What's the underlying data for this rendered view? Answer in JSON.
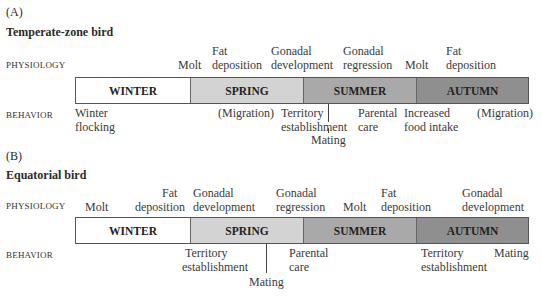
{
  "panels": [
    {
      "letter": "(A)",
      "title": "Temperate-zone bird",
      "physiology_label": "PHYSIOLOGY",
      "behavior_label": "BEHAVIOR",
      "seasons": [
        {
          "label": "WINTER",
          "color": "#ffffff"
        },
        {
          "label": "SPRING",
          "color": "#d3d3d3"
        },
        {
          "label": "SUMMER",
          "color": "#a9a9a9"
        },
        {
          "label": "AUTUMN",
          "color": "#8f8f8f"
        }
      ],
      "physiology": [
        {
          "lines": [
            "",
            "Molt"
          ]
        },
        {
          "lines": [
            "Fat",
            "deposition"
          ]
        },
        {
          "lines": [
            "Gonadal",
            "development"
          ]
        },
        {
          "lines": [
            "Gonadal",
            "regression"
          ]
        },
        {
          "lines": [
            "",
            "Molt"
          ]
        },
        {
          "lines": [
            "Fat",
            "deposition"
          ]
        }
      ],
      "behavior": [
        {
          "lines": [
            "Winter",
            "flocking"
          ]
        },
        {
          "lines": [
            "(Migration)",
            ""
          ]
        },
        {
          "lines": [
            "Territory",
            "establishment"
          ]
        },
        {
          "lines": [
            "Mating"
          ]
        },
        {
          "lines": [
            "Parental",
            "care"
          ]
        },
        {
          "lines": [
            "Increased",
            "food intake"
          ]
        },
        {
          "lines": [
            "(Migration)",
            ""
          ]
        }
      ]
    },
    {
      "letter": "(B)",
      "title": "Equatorial bird",
      "physiology_label": "PHYSIOLOGY",
      "behavior_label": "BEHAVIOR",
      "seasons": [
        {
          "label": "WINTER",
          "color": "#ffffff"
        },
        {
          "label": "SPRING",
          "color": "#d3d3d3"
        },
        {
          "label": "SUMMER",
          "color": "#a9a9a9"
        },
        {
          "label": "AUTUMN",
          "color": "#8f8f8f"
        }
      ],
      "physiology": [
        {
          "lines": [
            "",
            "Molt"
          ]
        },
        {
          "lines": [
            "Fat",
            "deposition"
          ]
        },
        {
          "lines": [
            "Gonadal",
            "development"
          ]
        },
        {
          "lines": [
            "Gonadal",
            "regression"
          ]
        },
        {
          "lines": [
            "",
            "Molt"
          ]
        },
        {
          "lines": [
            "Fat",
            "deposition"
          ]
        },
        {
          "lines": [
            "Gonadal",
            "development"
          ]
        }
      ],
      "behavior": [
        {
          "lines": [
            "Territory",
            "establishment"
          ]
        },
        {
          "lines": [
            "Mating"
          ]
        },
        {
          "lines": [
            "Parental",
            "care"
          ]
        },
        {
          "lines": [
            "Territory",
            "establishment"
          ]
        },
        {
          "lines": [
            "Mating",
            ""
          ]
        }
      ]
    }
  ]
}
